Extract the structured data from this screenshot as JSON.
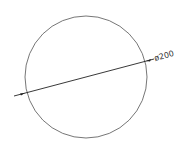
{
  "drawing": {
    "type": "circle-diameter-dimension",
    "dimension_label": "ø200",
    "colors": {
      "line": "#555555",
      "dimension": "#222222",
      "background": "#ffffff"
    }
  }
}
